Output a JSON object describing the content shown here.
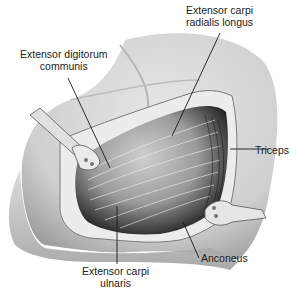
{
  "figure": {
    "labels": {
      "ecrl_line1": "Extensor carpi",
      "ecrl_line2": "radialis longus",
      "edc_line1": "Extensor digitorum",
      "edc_line2": "communis",
      "triceps": "Triceps",
      "anconeus": "Anconeus",
      "ecu_line1": "Extensor carpi",
      "ecu_line2": "ulnaris"
    }
  },
  "colors": {
    "skin": "#d9d9d9",
    "skin_shadow": "#a8a8a8",
    "muscle_light": "#c8c8c8",
    "muscle_dark": "#2a2a2a",
    "fat": "#e8e8e8",
    "leader_line": "#1a1a1a",
    "text": "#222222"
  }
}
